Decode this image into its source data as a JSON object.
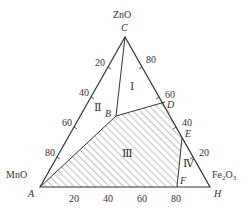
{
  "diagram": {
    "type": "ternary-phase-diagram",
    "components": {
      "top": {
        "name": "ZnO",
        "point": "C"
      },
      "left": {
        "name": "MnO",
        "point": "A"
      },
      "right": {
        "name": "Fe2O3",
        "name_sub_prefix": "Fe",
        "sub1": "2",
        "mid": "O",
        "sub2": "3",
        "point": "H"
      }
    },
    "points": {
      "A": "A",
      "B": "B",
      "C": "C",
      "D": "D",
      "E": "E",
      "F": "F",
      "H": "H"
    },
    "regions": {
      "r1": "Ⅰ",
      "r2": "Ⅱ",
      "r3": "Ⅲ",
      "r4": "Ⅳ"
    },
    "shaded_region": "Ⅲ",
    "left_axis_ticks": [
      "20",
      "40",
      "60",
      "80"
    ],
    "right_axis_ticks": [
      "80",
      "60",
      "40",
      "20"
    ],
    "bottom_axis_ticks": [
      "20",
      "40",
      "60",
      "80"
    ],
    "colors": {
      "line": "#333333",
      "hatch": "#555555",
      "background": "#ffffff"
    }
  }
}
